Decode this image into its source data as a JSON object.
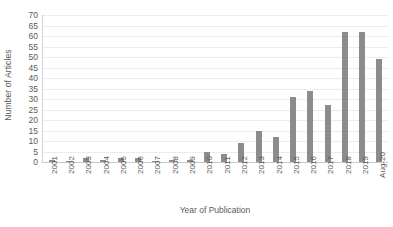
{
  "chart_data": {
    "type": "bar",
    "title": "",
    "xlabel": "Year of Publication",
    "ylabel": "Number of Articles",
    "categories": [
      "2001",
      "2002",
      "2003",
      "2004",
      "2005",
      "2006",
      "2007",
      "2008",
      "2009",
      "2010",
      "2011",
      "2012",
      "2013",
      "2014",
      "2015",
      "2016",
      "2017",
      "2018",
      "2019",
      "Aug-20"
    ],
    "values": [
      1,
      0,
      2,
      1,
      2,
      2,
      0,
      1,
      1,
      5,
      4,
      9,
      15,
      12,
      31,
      34,
      27,
      62,
      62,
      49
    ],
    "ylim": [
      0,
      70
    ],
    "yticks": [
      0,
      5,
      10,
      15,
      20,
      25,
      30,
      35,
      40,
      45,
      50,
      55,
      60,
      65,
      70
    ],
    "grid": true,
    "legend": false,
    "series_color": "#8c8c8c",
    "gridline_color": "#ececec",
    "text_color": "#5a5a5a"
  }
}
